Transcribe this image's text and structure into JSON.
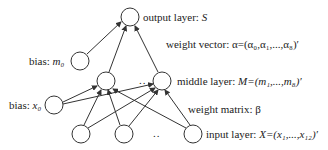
{
  "diagram": {
    "type": "neural-network",
    "labels": {
      "output_layer": "output layer: ",
      "output_symbol": "S",
      "bias_m": "bias: ",
      "bias_m_symbol": "m₀",
      "weight_vector": "weight vector: α=(α₀,α₁,...,α₈)′",
      "middle_layer": "middle layer: ",
      "middle_symbol": "M=(m₁,...,m₈)′",
      "bias_x": "bias: ",
      "bias_x_symbol": "x₀",
      "weight_matrix": "weight matrix: β",
      "input_layer": "input layer: ",
      "input_symbol": "X=(x₁,...,x₁₂)′",
      "ellipsis_middle": "..",
      "ellipsis_input": ".."
    },
    "nodes": [
      {
        "id": "output",
        "cx": 130,
        "cy": 17
      },
      {
        "id": "bias_m0",
        "cx": 80,
        "cy": 61
      },
      {
        "id": "middle_1",
        "cx": 106,
        "cy": 81
      },
      {
        "id": "middle_2",
        "cx": 162,
        "cy": 81
      },
      {
        "id": "bias_x0",
        "cx": 54,
        "cy": 105
      },
      {
        "id": "input_1",
        "cx": 81,
        "cy": 134
      },
      {
        "id": "input_2",
        "cx": 124,
        "cy": 134
      },
      {
        "id": "input_3",
        "cx": 193,
        "cy": 134
      }
    ],
    "stroke_color": "#333333"
  }
}
